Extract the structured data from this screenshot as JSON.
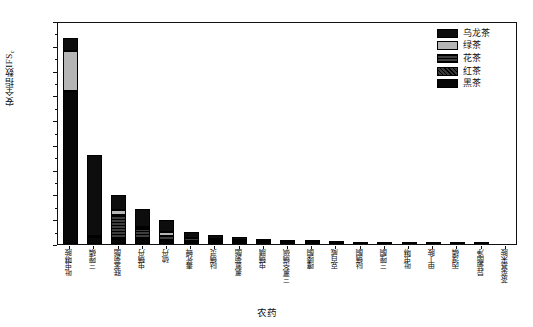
{
  "chart_data": {
    "type": "bar",
    "stacked": true,
    "title": "",
    "xlabel": "农药",
    "ylabel": "安全指数IFS",
    "ylabel_subscript": "c",
    "ylim": [
      0,
      0.009
    ],
    "ytick_labels": [
      "0.000",
      "0.001",
      "0.002",
      "0.003",
      "0.004",
      "0.005",
      "0.006",
      "0.007",
      "0.008",
      "0.009"
    ],
    "ytick_values": [
      0,
      0.001,
      0.002,
      0.003,
      0.004,
      0.005,
      0.006,
      0.007,
      0.008,
      0.009
    ],
    "grid": false,
    "legend_position": "top-right",
    "categories": [
      "吡虫啉胺",
      "三唑磷",
      "联苯菊酯",
      "虫螨丹",
      "硫丹",
      "毒死蜱",
      "哒螨灵",
      "氯氰菊酯",
      "虫螨腈",
      "三氯杀螨砜",
      "噻嗪酮",
      "克百威",
      "哒螨酮",
      "三唑酮",
      "吡虫啉",
      "甲丁胺",
      "丙溴磷",
      "异菊酯净",
      "茶菜基米胺"
    ],
    "series": [
      {
        "name": "黑茶",
        "color": "#070707",
        "pattern": "solid",
        "values": [
          0.00617,
          0.00027,
          0.00021,
          0.00019,
          0.00014,
          8e-05,
          7e-05,
          5e-05,
          4e-05,
          4e-05,
          3e-05,
          2e-05,
          1e-05,
          1e-05,
          0.0,
          0.0,
          0.0,
          0.0,
          0.0
        ]
      },
      {
        "name": "红茶",
        "color": "#272727",
        "pattern": "diagonal-hatch",
        "values": [
          0.0,
          0.0,
          0.0,
          0.0,
          0.0,
          0.0,
          0.0,
          0.0,
          0.0,
          0.0,
          0.0,
          0.0,
          0.0,
          0.0,
          0.0,
          0.0,
          0.0,
          0.0,
          0.0
        ]
      },
      {
        "name": "花茶",
        "color": "#2a2a2a",
        "pattern": "horizontal-hatch",
        "values": [
          0.0,
          0.0,
          0.00095,
          0.00043,
          0.00019,
          0.00015,
          0.00012,
          8e-05,
          6e-05,
          4e-05,
          3e-05,
          2e-05,
          1e-05,
          1e-05,
          0.0,
          0.0,
          0.0,
          0.0,
          0.0
        ]
      },
      {
        "name": "绿茶",
        "color": "#b5b5b5",
        "pattern": "solid",
        "values": [
          0.00161,
          5e-05,
          0.00022,
          5e-05,
          0.00016,
          3e-05,
          2e-05,
          2e-05,
          1e-05,
          1e-05,
          1e-05,
          1e-05,
          0.0,
          0.0,
          0.0,
          0.0,
          0.0,
          0.0,
          0.0
        ]
      },
      {
        "name": "乌龙茶",
        "color": "#0d0d0d",
        "pattern": "solid",
        "values": [
          0.00052,
          0.00327,
          0.0006,
          0.00074,
          0.00048,
          0.00023,
          0.00017,
          0.00014,
          0.0001,
          8e-05,
          6e-05,
          4e-05,
          3e-05,
          2e-05,
          2e-05,
          1e-05,
          1e-05,
          1e-05,
          0.0
        ]
      }
    ],
    "totals": [
      0.0083,
      0.00359,
      0.00198,
      0.00141,
      0.00097,
      0.00049,
      0.00038,
      0.00029,
      0.00021,
      0.00017,
      0.00013,
      9e-05,
      5e-05,
      4e-05,
      2e-05,
      1e-05,
      1e-05,
      1e-05,
      0.0
    ]
  },
  "legend": {
    "items": [
      {
        "label": "乌龙茶",
        "swatch": "fill-wulong"
      },
      {
        "label": "绿茶",
        "swatch": "fill-lv"
      },
      {
        "label": "花茶",
        "swatch": "fill-hua"
      },
      {
        "label": "红茶",
        "swatch": "fill-hong"
      },
      {
        "label": "黑茶",
        "swatch": "fill-hei"
      }
    ]
  }
}
